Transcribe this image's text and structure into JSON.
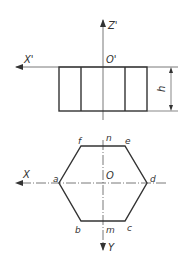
{
  "figure": {
    "front_view": {
      "axis_horizontal_label": "X'",
      "axis_vertical_label": "Z'",
      "origin_label": "O'",
      "dimension_label": "h"
    },
    "top_view": {
      "axis_horizontal_label": "X",
      "axis_vertical_label": "Y",
      "origin_label": "O",
      "vertices": {
        "a": "a",
        "b": "b",
        "c": "c",
        "d": "d",
        "e": "e",
        "f": "f",
        "m": "m",
        "n": "n"
      }
    },
    "colors": {
      "stroke": "#333333",
      "thin": "#555555",
      "background": "#ffffff"
    }
  }
}
